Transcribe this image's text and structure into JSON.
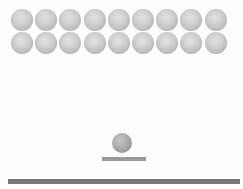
{
  "game": {
    "type": "breakout",
    "colors": {
      "brick": "#c8c8c8",
      "ball": "#a0a0a0",
      "paddle": "#9a9a9a",
      "floor": "#777777",
      "background": "#ffffff"
    },
    "bricks": {
      "rows": 2,
      "cols": 9,
      "origin_x": 11,
      "origin_y": 9,
      "spacing_x": 24.2,
      "spacing_y": 23,
      "size": 22
    },
    "ball": {
      "x": 112,
      "y": 133,
      "size": 20
    },
    "paddle": {
      "x": 102,
      "y": 157,
      "width": 44,
      "height": 4
    },
    "floor": {
      "x": 8,
      "y": 179,
      "width": 232,
      "height": 5
    }
  }
}
